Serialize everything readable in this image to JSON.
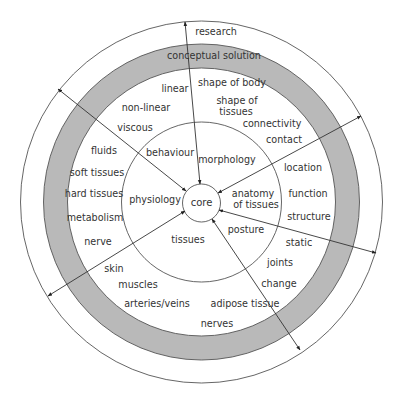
{
  "diagram": {
    "colors": {
      "ring_fill": "#b9b9b9",
      "stroke": "#555555",
      "text": "#333333",
      "background": "#ffffff"
    },
    "geometry": {
      "cx": 201.5,
      "cy": 202,
      "outer_r": 181,
      "gray_outer_r": 158,
      "gray_inner_r": 134,
      "middle_r": 80,
      "core_r": 19
    },
    "core": {
      "label": "core",
      "x": 201.5,
      "y": 206
    },
    "rings": {
      "outer_label": {
        "text": "research",
        "x": 216,
        "y": 35
      },
      "gray_label": {
        "text": "conceptual solution",
        "x": 214,
        "y": 59
      }
    },
    "sectors": [
      {
        "name": "morphology",
        "inner": [
          {
            "text": "morphology",
            "x": 227,
            "y": 163
          }
        ],
        "outer": [
          {
            "text": "shape of body",
            "x": 232,
            "y": 86
          },
          {
            "text": "shape of",
            "x": 237,
            "y": 104
          },
          {
            "text": "tissues",
            "x": 236,
            "y": 115
          },
          {
            "text": "connectivity",
            "x": 272,
            "y": 127
          }
        ]
      },
      {
        "name": "anatomy",
        "inner": [
          {
            "text": "anatomy",
            "x": 253,
            "y": 197
          },
          {
            "text": "of tissues",
            "x": 256,
            "y": 208
          },
          {
            "text": "posture",
            "x": 246,
            "y": 233
          }
        ],
        "outer": [
          {
            "text": "contact",
            "x": 284,
            "y": 143
          },
          {
            "text": "location",
            "x": 303,
            "y": 171
          },
          {
            "text": "function",
            "x": 308,
            "y": 197
          },
          {
            "text": "structure",
            "x": 309,
            "y": 220
          },
          {
            "text": "static",
            "x": 299,
            "y": 246
          },
          {
            "text": "joints",
            "x": 280,
            "y": 266
          },
          {
            "text": "change",
            "x": 279,
            "y": 287
          }
        ]
      },
      {
        "name": "tissues",
        "inner": [
          {
            "text": "tissues",
            "x": 188,
            "y": 243
          }
        ],
        "outer": [
          {
            "text": "skin",
            "x": 114,
            "y": 272
          },
          {
            "text": "muscles",
            "x": 138,
            "y": 288
          },
          {
            "text": "arteries/veins",
            "x": 157,
            "y": 307
          },
          {
            "text": "adipose tissue",
            "x": 245,
            "y": 307
          },
          {
            "text": "nerves",
            "x": 217,
            "y": 327
          }
        ]
      },
      {
        "name": "physiology",
        "inner": [
          {
            "text": "physiology",
            "x": 155,
            "y": 203
          }
        ],
        "outer": [
          {
            "text": "hard tissues",
            "x": 94,
            "y": 197
          },
          {
            "text": "metabolism",
            "x": 95,
            "y": 221
          },
          {
            "text": "nerve",
            "x": 98,
            "y": 245
          }
        ]
      },
      {
        "name": "behaviour",
        "inner": [
          {
            "text": "behaviour",
            "x": 170,
            "y": 156
          }
        ],
        "outer": [
          {
            "text": "linear",
            "x": 175,
            "y": 92
          },
          {
            "text": "non-linear",
            "x": 146,
            "y": 111
          },
          {
            "text": "viscous",
            "x": 135,
            "y": 131
          },
          {
            "text": "fluids",
            "x": 104,
            "y": 154
          },
          {
            "text": "soft tissues",
            "x": 97,
            "y": 176
          }
        ]
      }
    ],
    "arrows": [
      {
        "name": "arrow-research-top",
        "x1": 185,
        "y1": 22,
        "x2": 200,
        "y2": 184,
        "start_head": true,
        "end_head": true
      },
      {
        "name": "arrow-upper-left",
        "x1": 58,
        "y1": 89,
        "x2": 186,
        "y2": 191,
        "start_head": true,
        "end_head": true
      },
      {
        "name": "arrow-upper-right",
        "x1": 361,
        "y1": 116,
        "x2": 218,
        "y2": 193,
        "start_head": true,
        "end_head": true
      },
      {
        "name": "arrow-lower-right",
        "x1": 376,
        "y1": 253,
        "x2": 219,
        "y2": 210,
        "start_head": true,
        "end_head": true
      },
      {
        "name": "arrow-bottom",
        "x1": 300,
        "y1": 350,
        "x2": 212,
        "y2": 219,
        "start_head": true,
        "end_head": true
      },
      {
        "name": "arrow-lower-left",
        "x1": 48,
        "y1": 296,
        "x2": 185,
        "y2": 211,
        "start_head": true,
        "end_head": true
      }
    ]
  }
}
